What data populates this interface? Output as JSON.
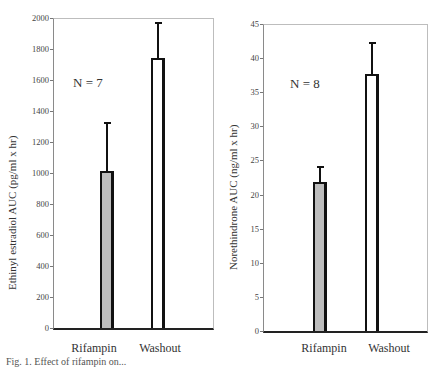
{
  "chart_data": [
    {
      "type": "bar",
      "title": "",
      "annotation": "N = 7",
      "categories": [
        "Rifampin",
        "Washout"
      ],
      "values": [
        1010,
        1740
      ],
      "error_upper": [
        1320,
        1965
      ],
      "bar_colors": [
        "#bdbdbd",
        "#ffffff"
      ],
      "xlabel": "",
      "ylabel": "Ethinyl estradiol AUC (pg/ml x hr)",
      "ylim": [
        0,
        2000
      ],
      "yticks": [
        0,
        200,
        400,
        600,
        800,
        1000,
        1200,
        1400,
        1600,
        1800,
        2000
      ],
      "grid": false,
      "legend": null
    },
    {
      "type": "bar",
      "title": "",
      "annotation": "N = 8",
      "categories": [
        "Rifampin",
        "Washout"
      ],
      "values": [
        21.9,
        37.7
      ],
      "error_upper": [
        24.0,
        42.2
      ],
      "bar_colors": [
        "#bdbdbd",
        "#ffffff"
      ],
      "xlabel": "",
      "ylabel": "Norethindrone AUC (ng/ml x hr)",
      "ylim": [
        0,
        45
      ],
      "yticks": [
        0,
        5,
        10,
        15,
        20,
        25,
        30,
        35,
        40,
        45
      ],
      "grid": false,
      "legend": null
    }
  ],
  "left": {
    "n_label": "N = 7",
    "ylabel": "Ethinyl estradiol AUC (pg/ml x hr)",
    "cat1": "Rifampin",
    "cat2": "Washout"
  },
  "right": {
    "n_label": "N = 8",
    "ylabel": "Norethindrone AUC (ng/ml x hr)",
    "cat1": "Rifampin",
    "cat2": "Washout"
  },
  "caption": "Fig. 1. Effect of rifampin on..."
}
